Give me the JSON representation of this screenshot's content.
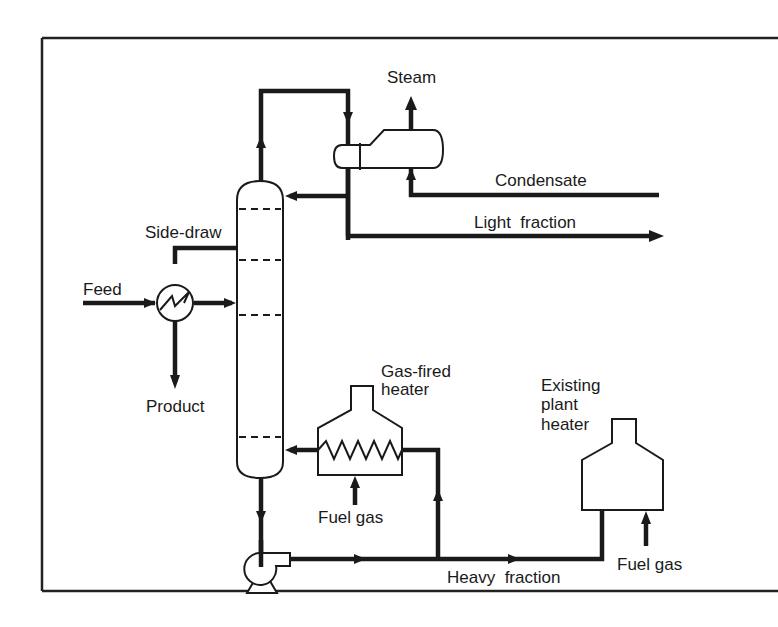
{
  "diagram": {
    "type": "process-flow-diagram",
    "labels": {
      "steam": "Steam",
      "condensate": "Condensate",
      "light_fraction": "Light  fraction",
      "side_draw": "Side-draw",
      "feed": "Feed",
      "product": "Product",
      "gas_fired_heater_1": "Gas-fired",
      "gas_fired_heater_2": "heater",
      "fuel_gas_1": "Fuel gas",
      "existing_1": "Existing",
      "existing_2": "plant",
      "existing_3": "heater",
      "fuel_gas_2": "Fuel gas",
      "heavy_fraction": "Heavy  fraction"
    },
    "nodes": [
      {
        "id": "column",
        "label": "Distillation column",
        "trays": 5
      },
      {
        "id": "condenser",
        "label": "Condenser / steam generator"
      },
      {
        "id": "feed_exchanger",
        "label": "Feed / side-draw heat exchanger"
      },
      {
        "id": "gas_fired_heater",
        "label": "Gas-fired heater"
      },
      {
        "id": "pump",
        "label": "Bottoms pump"
      },
      {
        "id": "existing_plant_heater",
        "label": "Existing plant heater"
      }
    ],
    "edges": [
      {
        "from": "feed",
        "to": "feed_exchanger"
      },
      {
        "from": "feed_exchanger",
        "to": "column"
      },
      {
        "from": "column",
        "to": "feed_exchanger",
        "label": "Side-draw"
      },
      {
        "from": "feed_exchanger",
        "to": "product"
      },
      {
        "from": "column",
        "to": "condenser",
        "label": "overhead"
      },
      {
        "from": "condenser",
        "to": "column",
        "label": "reflux"
      },
      {
        "from": "condenser",
        "to": "light_fraction"
      },
      {
        "from": "condensate",
        "to": "condenser"
      },
      {
        "from": "condenser",
        "to": "steam"
      },
      {
        "from": "column",
        "to": "pump"
      },
      {
        "from": "pump",
        "to": "gas_fired_heater"
      },
      {
        "from": "gas_fired_heater",
        "to": "column"
      },
      {
        "from": "fuel_gas",
        "to": "gas_fired_heater"
      },
      {
        "from": "pump",
        "to": "existing_plant_heater",
        "label": "Heavy fraction"
      },
      {
        "from": "fuel_gas",
        "to": "existing_plant_heater"
      }
    ],
    "colors": {
      "ink": "#1a1a1a",
      "background": "#ffffff"
    }
  }
}
